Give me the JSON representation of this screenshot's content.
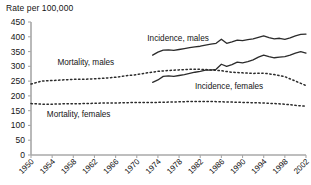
{
  "chart_data": {
    "type": "line",
    "title": "Rate per 100,000",
    "ylabel": "Rate per 100,000",
    "xlabel": "",
    "ylim": [
      0,
      450
    ],
    "yticks": [
      0,
      50,
      100,
      150,
      200,
      250,
      300,
      350,
      400,
      450
    ],
    "xlim": [
      1950,
      2002
    ],
    "xticks": [
      1950,
      1954,
      1958,
      1962,
      1966,
      1970,
      1974,
      1978,
      1982,
      1986,
      1990,
      1994,
      1998,
      2002
    ],
    "grid": false,
    "legend": "inline-annotations",
    "series": [
      {
        "name": "Incidence, males",
        "style": "solid",
        "color": "#2b2b2b",
        "label_x": 1972,
        "label_y": 385,
        "x": [
          1973,
          1974,
          1975,
          1976,
          1977,
          1978,
          1979,
          1980,
          1981,
          1982,
          1983,
          1984,
          1985,
          1986,
          1987,
          1988,
          1989,
          1990,
          1991,
          1992,
          1993,
          1994,
          1995,
          1996,
          1997,
          1998,
          1999,
          2000,
          2001,
          2002
        ],
        "values": [
          338,
          348,
          355,
          356,
          354,
          357,
          360,
          363,
          366,
          368,
          372,
          375,
          378,
          392,
          378,
          383,
          389,
          387,
          390,
          393,
          398,
          403,
          397,
          393,
          395,
          391,
          396,
          403,
          408,
          409
        ]
      },
      {
        "name": "Incidence, females",
        "style": "solid",
        "color": "#2b2b2b",
        "label_x": 1981,
        "label_y": 222,
        "x": [
          1973,
          1974,
          1975,
          1976,
          1977,
          1978,
          1979,
          1980,
          1981,
          1982,
          1983,
          1984,
          1985,
          1986,
          1987,
          1988,
          1989,
          1990,
          1991,
          1992,
          1993,
          1994,
          1995,
          1996,
          1997,
          1998,
          1999,
          2000,
          2001,
          2002
        ],
        "values": [
          246,
          254,
          266,
          268,
          266,
          269,
          272,
          276,
          280,
          283,
          287,
          287,
          290,
          307,
          300,
          306,
          314,
          312,
          316,
          322,
          331,
          338,
          333,
          329,
          331,
          333,
          338,
          345,
          350,
          345
        ]
      },
      {
        "name": "Mortality, males",
        "style": "dotted",
        "color": "#2b2b2b",
        "label_x": 1955,
        "label_y": 305,
        "x": [
          1950,
          1952,
          1954,
          1956,
          1958,
          1960,
          1962,
          1964,
          1966,
          1968,
          1970,
          1972,
          1974,
          1976,
          1978,
          1980,
          1982,
          1984,
          1986,
          1988,
          1990,
          1992,
          1994,
          1996,
          1998,
          2000,
          2002
        ],
        "values": [
          240,
          250,
          252,
          254,
          256,
          256,
          258,
          260,
          263,
          268,
          272,
          278,
          283,
          286,
          288,
          290,
          290,
          288,
          285,
          280,
          278,
          276,
          277,
          272,
          265,
          250,
          235
        ]
      },
      {
        "name": "Mortality, females",
        "style": "dotted",
        "color": "#2b2b2b",
        "label_x": 1953,
        "label_y": 128,
        "x": [
          1950,
          1952,
          1954,
          1956,
          1958,
          1960,
          1962,
          1964,
          1966,
          1968,
          1970,
          1972,
          1974,
          1976,
          1978,
          1980,
          1982,
          1984,
          1986,
          1988,
          1990,
          1992,
          1994,
          1996,
          1998,
          2000,
          2002
        ],
        "values": [
          174,
          172,
          172,
          173,
          173,
          174,
          175,
          176,
          176,
          177,
          178,
          178,
          178,
          179,
          180,
          181,
          181,
          181,
          180,
          179,
          178,
          177,
          176,
          174,
          172,
          168,
          165
        ]
      }
    ]
  }
}
